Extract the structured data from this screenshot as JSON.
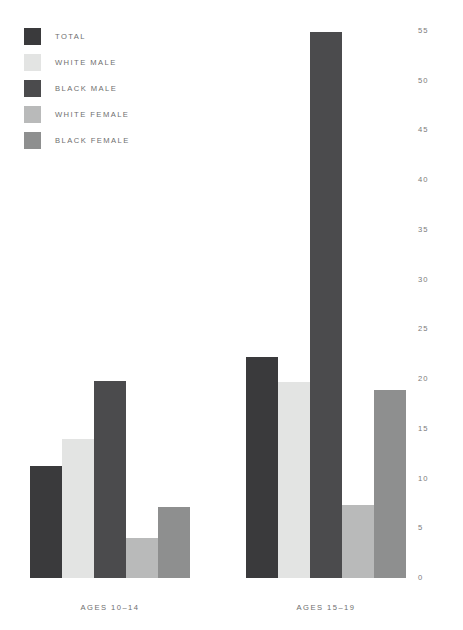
{
  "legend": {
    "items": [
      {
        "label": "TOTAL",
        "color": "#3a3a3c"
      },
      {
        "label": "WHITE MALE",
        "color": "#e3e4e3"
      },
      {
        "label": "BLACK MALE",
        "color": "#4b4b4d"
      },
      {
        "label": "WHITE FEMALE",
        "color": "#b9baba"
      },
      {
        "label": "BLACK FEMALE",
        "color": "#8e8f8f"
      }
    ]
  },
  "axis": {
    "ticks": [
      {
        "label": "55",
        "value": 55
      },
      {
        "label": "50",
        "value": 50
      },
      {
        "label": "45",
        "value": 45
      },
      {
        "label": "40",
        "value": 40
      },
      {
        "label": "35",
        "value": 35
      },
      {
        "label": "30",
        "value": 30
      },
      {
        "label": "25",
        "value": 25
      },
      {
        "label": "20",
        "value": 20
      },
      {
        "label": "15",
        "value": 15
      },
      {
        "label": "10",
        "value": 10
      },
      {
        "label": "5",
        "value": 5
      },
      {
        "label": "0",
        "value": 0
      }
    ]
  },
  "categories": [
    {
      "label": "AGES 10–14"
    },
    {
      "label": "AGES 15–19"
    }
  ],
  "chart_data": {
    "type": "bar",
    "title": "",
    "xlabel": "",
    "ylabel": "",
    "ylim": [
      0,
      55
    ],
    "grid": false,
    "legend_position": "top-left",
    "axis_position": "right",
    "categories": [
      "AGES 10–14",
      "AGES 15–19"
    ],
    "series": [
      {
        "name": "TOTAL",
        "color": "#3a3a3c",
        "values": [
          11.3,
          22.2
        ]
      },
      {
        "name": "WHITE MALE",
        "color": "#e3e4e3",
        "values": [
          14.0,
          19.7
        ]
      },
      {
        "name": "BLACK MALE",
        "color": "#4b4b4d",
        "values": [
          19.8,
          54.9
        ]
      },
      {
        "name": "WHITE FEMALE",
        "color": "#b9baba",
        "values": [
          4.0,
          7.3
        ]
      },
      {
        "name": "BLACK FEMALE",
        "color": "#8e8f8f",
        "values": [
          7.1,
          18.9
        ]
      }
    ]
  }
}
